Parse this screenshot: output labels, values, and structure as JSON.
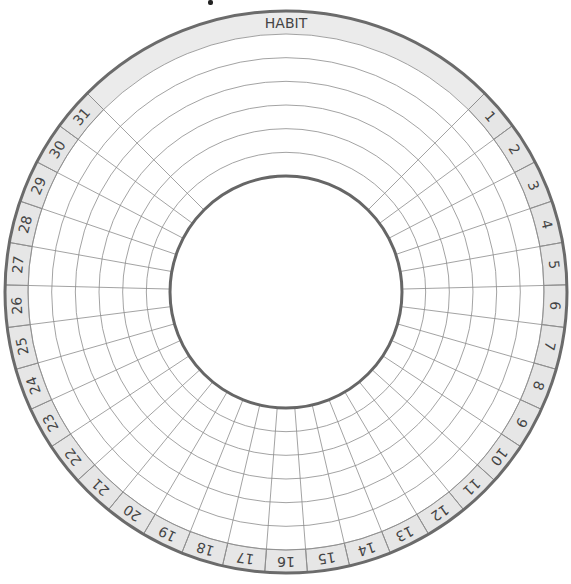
{
  "tracker": {
    "title": "HABIT",
    "day_labels": [
      "1",
      "2",
      "3",
      "4",
      "5",
      "6",
      "7",
      "8",
      "9",
      "10",
      "11",
      "12",
      "13",
      "14",
      "15",
      "16",
      "17",
      "18",
      "19",
      "20",
      "21",
      "22",
      "23",
      "24",
      "25",
      "26",
      "27",
      "28",
      "29",
      "30",
      "31"
    ],
    "habit_rings": 6,
    "geometry": {
      "cx": 286,
      "cy": 292,
      "outer_radius": 281,
      "band_inner_radius": 258,
      "inner_radius": 116,
      "header_span_degrees": 90
    },
    "colors": {
      "band_fill": "#e6e6e6",
      "header_fill": "#ebebeb",
      "outer_stroke": "#6b6b6b",
      "inner_stroke": "#666666",
      "grid_stroke": "#8c8c8c",
      "text": "#444444"
    }
  }
}
